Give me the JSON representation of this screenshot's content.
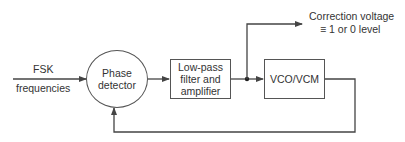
{
  "input": {
    "label_top": "FSK",
    "label_bottom": "frequencies"
  },
  "phase_detector": {
    "line1": "Phase",
    "line2": "detector"
  },
  "filter": {
    "line1": "Low-pass",
    "line2": "filter and",
    "line3": "amplifier"
  },
  "vco": {
    "label": "VCO/VCM"
  },
  "output": {
    "line1": "Correction voltage",
    "line2": "≡ 1 or 0 level"
  },
  "colors": {
    "line": "#444444",
    "text": "#333333",
    "background": "#ffffff"
  }
}
